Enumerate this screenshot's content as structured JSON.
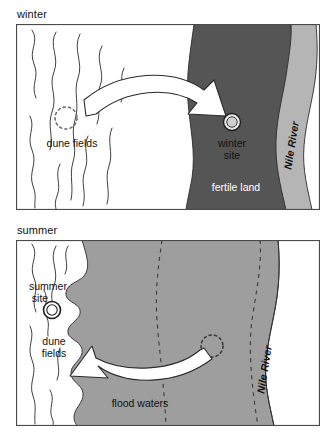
{
  "figure": {
    "panels": [
      {
        "id": "winter",
        "caption": "winter",
        "labels": {
          "dune_fields": "dune fields",
          "site": "winter site",
          "site_line1": "winter",
          "site_line2": "site",
          "land": "fertile land",
          "river": "Nile River"
        },
        "markers": {
          "ghost_site": "dotted-circle-ghost-position",
          "active_site": "winter-site-marker"
        },
        "arrow": "arrow-dune-to-fertile-land"
      },
      {
        "id": "summer",
        "caption": "summer",
        "labels": {
          "dune_fields_line1": "dune",
          "dune_fields_line2": "fields",
          "site_line1": "summer",
          "site_line2": "site",
          "water": "flood waters",
          "river": "Nile River"
        },
        "markers": {
          "ghost_site": "dotted-circle-ghost-position",
          "active_site": "summer-site-marker"
        },
        "arrow": "arrow-flood-to-dune-fields",
        "dashed_lines": "submerged-nile-banks"
      }
    ],
    "colors": {
      "fertile_land": "#555555",
      "nile_river_band": "#b5b5b5",
      "flood_waters": "#9e9e9e",
      "background": "#ffffff",
      "stroke": "#2b2b2b",
      "arrow_fill": "#ffffff",
      "text": "#111111"
    }
  }
}
